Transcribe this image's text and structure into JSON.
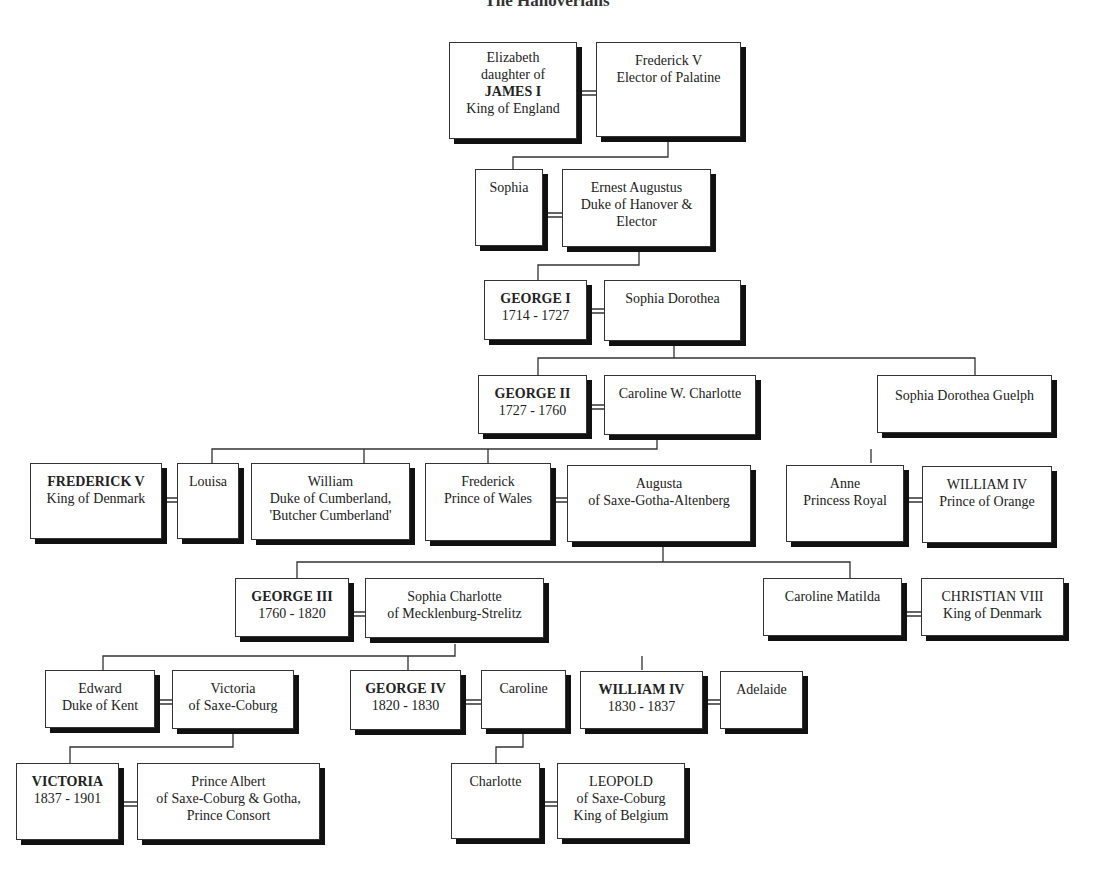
{
  "title": "The Hanoverians",
  "boxes": {
    "elizabeth": {
      "lines": [
        "Elizabeth",
        "daughter of",
        "JAMES I",
        "King of England"
      ]
    },
    "frederick_palatine": {
      "lines": [
        "Frederick V",
        "Elector of Palatine"
      ]
    },
    "sophia": {
      "lines": [
        "Sophia"
      ]
    },
    "ernest_augustus": {
      "lines": [
        "Ernest Augustus",
        "Duke of Hanover &",
        "Elector"
      ]
    },
    "george1": {
      "lines": [
        "GEORGE I",
        "1714 - 1727"
      ]
    },
    "sophia_dorothea": {
      "lines": [
        "Sophia Dorothea"
      ]
    },
    "george2": {
      "lines": [
        "GEORGE II",
        "1727 - 1760"
      ]
    },
    "caroline_charlotte": {
      "lines": [
        "Caroline W. Charlotte"
      ]
    },
    "sophia_dorothea_guelph": {
      "lines": [
        "Sophia Dorothea Guelph"
      ]
    },
    "frederick_denmark": {
      "lines": [
        "FREDERICK V",
        "King of Denmark"
      ]
    },
    "louisa": {
      "lines": [
        "Louisa"
      ]
    },
    "william_cumberland": {
      "lines": [
        "William",
        "Duke of Cumberland,",
        "'Butcher Cumberland'"
      ]
    },
    "frederick_wales": {
      "lines": [
        "Frederick",
        "Prince of Wales"
      ]
    },
    "augusta": {
      "lines": [
        "Augusta",
        "of Saxe-Gotha-Altenberg"
      ]
    },
    "anne": {
      "lines": [
        "Anne",
        "Princess Royal"
      ]
    },
    "william_orange": {
      "lines": [
        "WILLIAM IV",
        "Prince of Orange"
      ]
    },
    "george3": {
      "lines": [
        "GEORGE III",
        "1760 - 1820"
      ]
    },
    "sophia_charlotte": {
      "lines": [
        "Sophia Charlotte",
        "of Mecklenburg-Strelitz"
      ]
    },
    "caroline_matilda": {
      "lines": [
        "Caroline Matilda"
      ]
    },
    "christian8": {
      "lines": [
        "CHRISTIAN VIII",
        "King of Denmark"
      ]
    },
    "edward_kent": {
      "lines": [
        "Edward",
        "Duke of Kent"
      ]
    },
    "victoria_coburg": {
      "lines": [
        "Victoria",
        "of Saxe-Coburg"
      ]
    },
    "george4": {
      "lines": [
        "GEORGE IV",
        "1820 - 1830"
      ]
    },
    "caroline": {
      "lines": [
        "Caroline"
      ]
    },
    "william4": {
      "lines": [
        "WILLIAM IV",
        "1830 - 1837"
      ]
    },
    "adelaide": {
      "lines": [
        "Adelaide"
      ]
    },
    "victoria": {
      "lines": [
        "VICTORIA",
        "1837 - 1901"
      ]
    },
    "albert": {
      "lines": [
        "Prince Albert",
        "of Saxe-Coburg & Gotha,",
        "Prince Consort"
      ]
    },
    "charlotte": {
      "lines": [
        "Charlotte"
      ]
    },
    "leopold": {
      "lines": [
        "LEOPOLD",
        "of Saxe-Coburg",
        "King of Belgium"
      ]
    }
  }
}
